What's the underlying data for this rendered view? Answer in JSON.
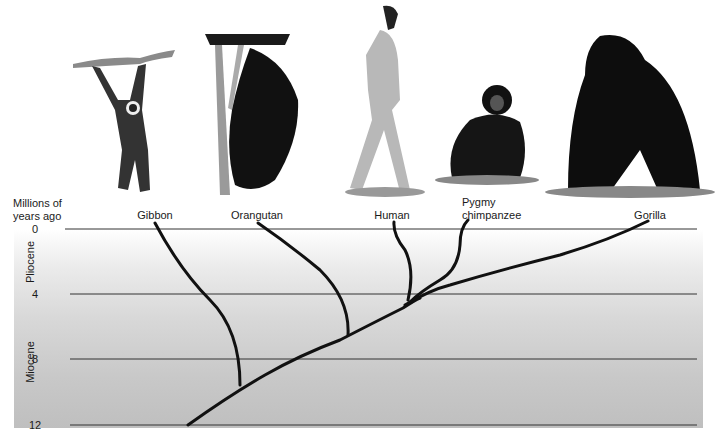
{
  "axis": {
    "title_line1": "Millions of",
    "title_line2": "years ago",
    "ticks": [
      {
        "label": "0",
        "y": 229
      },
      {
        "label": "4",
        "y": 294
      },
      {
        "label": "8",
        "y": 359
      },
      {
        "label": "12",
        "y": 425
      }
    ],
    "range": [
      0,
      12
    ]
  },
  "epochs": [
    {
      "label": "Pliocene",
      "range": [
        0,
        5
      ]
    },
    {
      "label": "Miocene",
      "range": [
        5,
        12
      ]
    }
  ],
  "taxa": [
    {
      "label": "Gibbon",
      "x": 155
    },
    {
      "label": "Orangutan",
      "x": 257
    },
    {
      "label": "Human",
      "x": 392
    },
    {
      "label_line1": "Pygmy",
      "label_line2": "chimpanzee",
      "x": 476
    },
    {
      "label": "Gorilla",
      "x": 650
    }
  ],
  "divergences_mya": {
    "gibbon": 10.5,
    "orangutan": 7,
    "gorilla": 5,
    "human_chimp": 4.5
  },
  "colors": {
    "panel_top": "#ffffff",
    "panel_bottom": "#bfbfbf",
    "line": "#111111",
    "grid": "#333333"
  }
}
